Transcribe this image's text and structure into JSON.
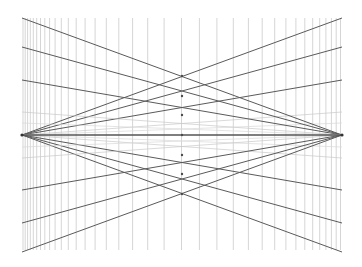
{
  "figure": {
    "background_color": "#ffffff",
    "width": 362,
    "height": 267
  },
  "chart_data": {
    "type": "line",
    "subtitle": "",
    "xlabel": "",
    "ylabel": "",
    "grid": true,
    "legend_position": "none",
    "xlim": [
      0,
      362
    ],
    "ylim": [
      0,
      267
    ],
    "plot_area": {
      "x0": 22,
      "y0": 18,
      "x1": 342,
      "y1": 250
    },
    "horizon": {
      "name": "horizon-line",
      "y": 135,
      "x0": 22,
      "x1": 342,
      "color": "#555555",
      "width": 1.3
    },
    "vanishing_points": [
      {
        "name": "left-vanishing-point",
        "x": 22,
        "y": 135,
        "radius": 1.6,
        "color": "#333333"
      },
      {
        "name": "right-vanishing-point",
        "x": 342,
        "y": 135,
        "radius": 1.6,
        "color": "#333333"
      }
    ],
    "center_vertical_x": 182,
    "vertical_lines": {
      "color": "#b8b8b8",
      "width": 0.6,
      "top": 18,
      "bottom": 250,
      "x_positions": [
        23,
        25.2,
        27.6,
        30.3,
        33.3,
        36.7,
        40.5,
        44.8,
        49.6,
        55.1,
        61.3,
        68.3,
        76.2,
        85.1,
        95.1,
        106.3,
        118.8,
        132.6,
        147.7,
        164.1,
        181.5,
        199.4,
        216.9,
        233.3,
        248.4,
        262.2,
        274.7,
        285.9,
        295.9,
        304.8,
        312.7,
        319.7,
        325.9,
        331.4,
        336.2,
        340.5
      ]
    },
    "left_fan": {
      "name": "left-vanishing-fan",
      "origin": {
        "x": 22,
        "y": 135
      },
      "rays": [
        {
          "end_x": 342,
          "end_y": 18,
          "color": "#5a5a5a",
          "width": 1.0
        },
        {
          "end_x": 342,
          "end_y": 47,
          "color": "#5a5a5a",
          "width": 1.0
        },
        {
          "end_x": 342,
          "end_y": 80,
          "color": "#5a5a5a",
          "width": 1.0
        },
        {
          "end_x": 342,
          "end_y": 112,
          "color": "#c9c9c9",
          "width": 0.7
        },
        {
          "end_x": 342,
          "end_y": 123,
          "color": "#d8d8d8",
          "width": 0.7
        },
        {
          "end_x": 342,
          "end_y": 147,
          "color": "#d8d8d8",
          "width": 0.7
        },
        {
          "end_x": 342,
          "end_y": 158,
          "color": "#c9c9c9",
          "width": 0.7
        },
        {
          "end_x": 342,
          "end_y": 190,
          "color": "#5a5a5a",
          "width": 1.0
        },
        {
          "end_x": 342,
          "end_y": 223,
          "color": "#5a5a5a",
          "width": 1.0
        },
        {
          "end_x": 342,
          "end_y": 252,
          "color": "#5a5a5a",
          "width": 1.0
        }
      ]
    },
    "right_fan": {
      "name": "right-vanishing-fan",
      "origin": {
        "x": 342,
        "y": 135
      },
      "rays": [
        {
          "end_x": 22,
          "end_y": 18,
          "color": "#5a5a5a",
          "width": 1.0
        },
        {
          "end_x": 22,
          "end_y": 47,
          "color": "#5a5a5a",
          "width": 1.0
        },
        {
          "end_x": 22,
          "end_y": 80,
          "color": "#5a5a5a",
          "width": 1.0
        },
        {
          "end_x": 22,
          "end_y": 112,
          "color": "#c9c9c9",
          "width": 0.7
        },
        {
          "end_x": 22,
          "end_y": 123,
          "color": "#d8d8d8",
          "width": 0.7
        },
        {
          "end_x": 22,
          "end_y": 147,
          "color": "#d8d8d8",
          "width": 0.7
        },
        {
          "end_x": 22,
          "end_y": 158,
          "color": "#c9c9c9",
          "width": 0.7
        },
        {
          "end_x": 22,
          "end_y": 190,
          "color": "#5a5a5a",
          "width": 1.0
        },
        {
          "end_x": 22,
          "end_y": 223,
          "color": "#5a5a5a",
          "width": 1.0
        },
        {
          "end_x": 22,
          "end_y": 252,
          "color": "#5a5a5a",
          "width": 1.0
        }
      ]
    },
    "intersection_nodes": {
      "color": "#4a4a4a",
      "radius": 1.2,
      "points": [
        {
          "x": 182,
          "y": 76
        },
        {
          "x": 182,
          "y": 96
        },
        {
          "x": 182,
          "y": 115
        },
        {
          "x": 182,
          "y": 135
        },
        {
          "x": 182,
          "y": 155
        },
        {
          "x": 182,
          "y": 174
        },
        {
          "x": 182,
          "y": 194
        }
      ]
    }
  }
}
